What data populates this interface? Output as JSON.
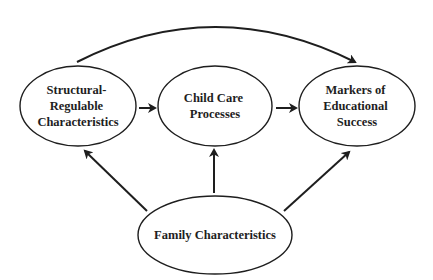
{
  "diagram": {
    "nodes": {
      "structural": {
        "lines": [
          "Structural-",
          "Regulable",
          "Characteristics"
        ],
        "cx": 78,
        "cy": 106,
        "rx": 58,
        "ry": 40
      },
      "processes": {
        "lines": [
          "Child Care",
          "Processes"
        ],
        "cx": 215,
        "cy": 106,
        "rx": 57,
        "ry": 40
      },
      "markers": {
        "lines": [
          "Markers of",
          "Educational",
          "Success"
        ],
        "cx": 357,
        "cy": 106,
        "rx": 58,
        "ry": 40
      },
      "family": {
        "lines": [
          "Family Characteristics"
        ],
        "cx": 215,
        "cy": 235,
        "rx": 77,
        "ry": 39
      }
    },
    "edges": [
      {
        "from": "structural",
        "to": "processes"
      },
      {
        "from": "processes",
        "to": "markers"
      },
      {
        "from": "structural",
        "to": "markers",
        "shape": "arc"
      },
      {
        "from": "family",
        "to": "structural"
      },
      {
        "from": "family",
        "to": "processes"
      },
      {
        "from": "family",
        "to": "markers"
      }
    ],
    "colors": {
      "stroke": "#1e1e1e",
      "background": "#ffffff"
    }
  }
}
